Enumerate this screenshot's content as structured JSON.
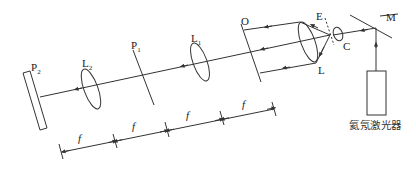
{
  "diagram": {
    "title": "",
    "components": {
      "P2": {
        "label": "P",
        "sub": "2",
        "kind": "screen plate"
      },
      "L2": {
        "label": "L",
        "sub": "2",
        "kind": "lens"
      },
      "P1": {
        "label": "P",
        "sub": "1",
        "kind": "focal plane"
      },
      "L1": {
        "label": "L",
        "sub": "1",
        "kind": "lens"
      },
      "O": {
        "label": "O",
        "kind": "object plane"
      },
      "L": {
        "label": "L",
        "kind": "collimating lens"
      },
      "E": {
        "label": "E",
        "kind": "pinhole"
      },
      "C": {
        "label": "C",
        "kind": "microscope objective"
      },
      "M": {
        "label": "M",
        "kind": "mirror"
      },
      "laser": {
        "label": "氦氖激光器",
        "kind": "He-Ne laser"
      }
    },
    "dimensions": [
      {
        "label": "f"
      },
      {
        "label": "f"
      },
      {
        "label": "f"
      },
      {
        "label": "f"
      }
    ],
    "colors": {
      "line": "#333333",
      "background": "#ffffff"
    }
  }
}
